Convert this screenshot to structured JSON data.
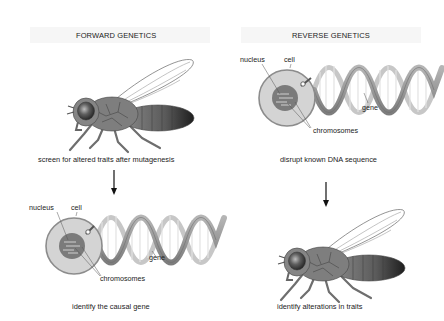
{
  "forward": {
    "title": "FORWARD GENETICS",
    "step1_caption": "screen for altered traits after mutagenesis",
    "step2_caption": "identify the causal gene",
    "labels": {
      "nucleus": "nucleus",
      "cell": "cell",
      "gene": "gene",
      "chromosomes": "chromosomes"
    }
  },
  "reverse": {
    "title": "REVERSE GENETICS",
    "step1_caption": "disrupt known DNA sequence",
    "step2_caption": "identify alterations in traits",
    "labels": {
      "nucleus": "nucleus",
      "cell": "cell",
      "gene": "gene",
      "chromosomes": "chromosomes"
    }
  },
  "colors": {
    "fly_body": "#7a7a7a",
    "fly_dark": "#3a3a3a",
    "cell_fill": "#d6d6d6",
    "cell_border": "#8a8a8a",
    "nucleus_fill": "#7c7c7c",
    "dna_strand": "#9a9a9a",
    "arrow": "#111111"
  }
}
